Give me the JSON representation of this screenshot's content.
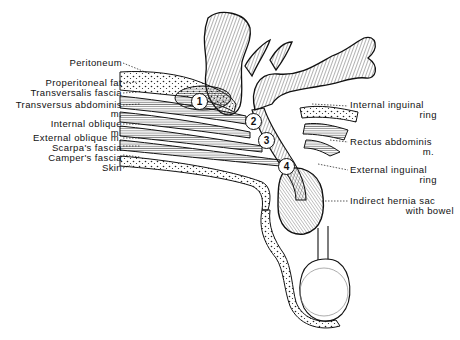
{
  "figure": {
    "left_labels": [
      {
        "id": "peritoneum",
        "text": "Peritoneum"
      },
      {
        "id": "properitoneal-fat",
        "text": "Properitoneal fat"
      },
      {
        "id": "transversalis-fascia",
        "text": "Transversalis fascia"
      },
      {
        "id": "transversus-abdominis",
        "line1": "Transversus abdominis",
        "line2": "m."
      },
      {
        "id": "internal-oblique",
        "line1": "Internal oblique",
        "line2": "m."
      },
      {
        "id": "external-oblique",
        "text": "External oblique m."
      },
      {
        "id": "scarpas-fascia",
        "text": "Scarpa's fascia"
      },
      {
        "id": "campers-fascia",
        "text": "Camper's fascia"
      },
      {
        "id": "skin",
        "text": "Skin"
      }
    ],
    "right_labels": [
      {
        "id": "internal-inguinal-ring",
        "line1": "Internal inguinal",
        "line2": "ring"
      },
      {
        "id": "rectus-abdominis",
        "line1": "Rectus abdominis",
        "line2": "m."
      },
      {
        "id": "external-inguinal-ring",
        "line1": "External inguinal",
        "line2": "ring"
      },
      {
        "id": "indirect-hernia-sac",
        "line1": "Indirect hernia sac",
        "line2": "with bowel"
      }
    ],
    "markers": [
      "1",
      "2",
      "3",
      "4"
    ]
  }
}
